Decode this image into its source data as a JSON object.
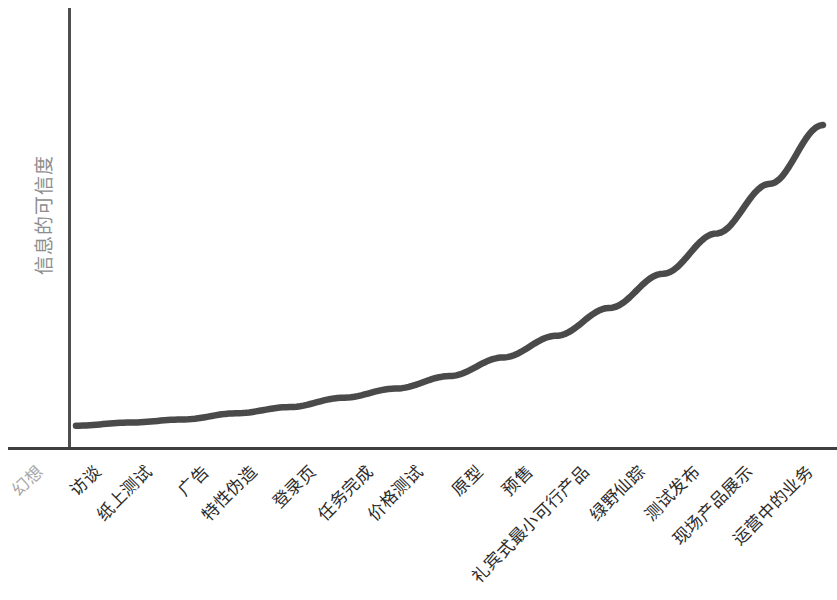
{
  "chart_data": {
    "type": "line",
    "title": "",
    "subtitle": "",
    "xlabel": "",
    "ylabel": "信息的可信度",
    "grid": false,
    "legend": null,
    "xlim": [
      0,
      15
    ],
    "ylim": [
      0,
      1
    ],
    "annotations": [],
    "categories": [
      "幻想",
      "访谈",
      "纸上测试",
      "广告",
      "特性伪造",
      "登录页",
      "任务完成",
      "价格测试",
      "原型",
      "预售",
      "礼宾式最小可行产品",
      "绿野仙踪",
      "测试发布",
      "现场产品展示",
      "运营中的业务"
    ],
    "x": [
      0,
      1,
      2,
      3,
      4,
      5,
      6,
      7,
      8,
      9,
      10,
      11,
      12,
      13,
      14
    ],
    "values": [
      0.03,
      0.04,
      0.05,
      0.07,
      0.09,
      0.12,
      0.15,
      0.19,
      0.25,
      0.32,
      0.41,
      0.52,
      0.65,
      0.81,
      1.0
    ],
    "series": [
      {
        "name": "信息的可信度",
        "color": "#4a4a4a",
        "values": [
          0.03,
          0.04,
          0.05,
          0.07,
          0.09,
          0.12,
          0.15,
          0.19,
          0.25,
          0.32,
          0.41,
          0.52,
          0.65,
          0.81,
          1.0
        ]
      }
    ]
  },
  "axes": {
    "y_title": "信息的可信度",
    "y_title_color": "#8d8d8d",
    "axis_color": "#4e4e4e",
    "curve_color": "#4a4a4a"
  },
  "ticks": [
    {
      "label": "幻想",
      "muted": true
    },
    {
      "label": "访谈",
      "muted": false
    },
    {
      "label": "纸上测试",
      "muted": false
    },
    {
      "label": "广告",
      "muted": false
    },
    {
      "label": "特性伪造",
      "muted": false
    },
    {
      "label": "登录页",
      "muted": false
    },
    {
      "label": "任务完成",
      "muted": false
    },
    {
      "label": "价格测试",
      "muted": false
    },
    {
      "label": "原型",
      "muted": false
    },
    {
      "label": "预售",
      "muted": false
    },
    {
      "label": "礼宾式最小可行产品",
      "muted": false
    },
    {
      "label": "绿野仙踪",
      "muted": false
    },
    {
      "label": "测试发布",
      "muted": false
    },
    {
      "label": "现场产品展示",
      "muted": false
    },
    {
      "label": "运营中的业务",
      "muted": false
    }
  ],
  "tick_positions": [
    30,
    88,
    139,
    196,
    244,
    303,
    360,
    410,
    470,
    520,
    576,
    632,
    687,
    740,
    800
  ]
}
